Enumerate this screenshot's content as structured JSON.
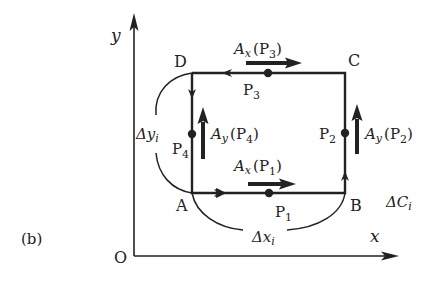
{
  "figure_label": "(b)",
  "axes": {
    "origin": "O",
    "x_label": "x",
    "y_label": "y"
  },
  "corners": {
    "A": "A",
    "B": "B",
    "C": "C",
    "D": "D"
  },
  "points": {
    "p1": {
      "main": "P",
      "sub": "1"
    },
    "p2": {
      "main": "P",
      "sub": "2"
    },
    "p3": {
      "main": "P",
      "sub": "3"
    },
    "p4": {
      "main": "P",
      "sub": "4"
    }
  },
  "vectors": {
    "ax_p1": {
      "A": "A",
      "comp": "x",
      "open": "(P",
      "sub": "1",
      "close": ")"
    },
    "ax_p3": {
      "A": "A",
      "comp": "x",
      "open": "(P",
      "sub": "3",
      "close": ")"
    },
    "ay_p2": {
      "A": "A",
      "comp": "y",
      "open": "(P",
      "sub": "2",
      "close": ")"
    },
    "ay_p4": {
      "A": "A",
      "comp": "y",
      "open": "(P",
      "sub": "4",
      "close": ")"
    }
  },
  "increments": {
    "dx": {
      "delta": "Δx",
      "sub": "i"
    },
    "dy": {
      "delta": "Δy",
      "sub": "i"
    },
    "dc": {
      "delta": "ΔC",
      "sub": "i"
    }
  },
  "colors": {
    "ink": "#222222",
    "background": "#ffffff"
  }
}
